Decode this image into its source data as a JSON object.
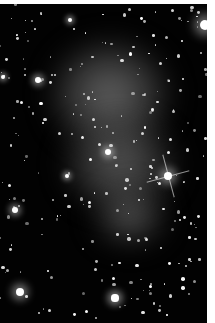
{
  "image": {
    "subject": "deep-field astronomical image of a galaxy cluster with diffuse glowing nebulosity",
    "palette": {
      "background": "#020202",
      "border": "#ffffff",
      "glow": "#8a8a8a",
      "star": "#ffffff"
    },
    "regions": [
      {
        "name": "upper-glow",
        "cx": 110,
        "cy": 95,
        "rx": 60,
        "ry": 55
      },
      {
        "name": "middle-glow",
        "cx": 120,
        "cy": 160,
        "rx": 50,
        "ry": 40
      },
      {
        "name": "lower-glow",
        "cx": 130,
        "cy": 215,
        "rx": 35,
        "ry": 25
      }
    ],
    "bright_stars": [
      {
        "x": 168,
        "y": 176,
        "r": 7,
        "spikes": true
      },
      {
        "x": 20,
        "y": 292,
        "r": 7
      },
      {
        "x": 115,
        "y": 298,
        "r": 6
      },
      {
        "x": 205,
        "y": 25,
        "r": 9
      },
      {
        "x": 108,
        "y": 152,
        "r": 5
      },
      {
        "x": 67,
        "y": 176,
        "r": 4
      },
      {
        "x": 38,
        "y": 80,
        "r": 5
      },
      {
        "x": 70,
        "y": 20,
        "r": 4
      },
      {
        "x": 15,
        "y": 210,
        "r": 5
      },
      {
        "x": 3,
        "y": 77,
        "r": 4
      }
    ]
  }
}
